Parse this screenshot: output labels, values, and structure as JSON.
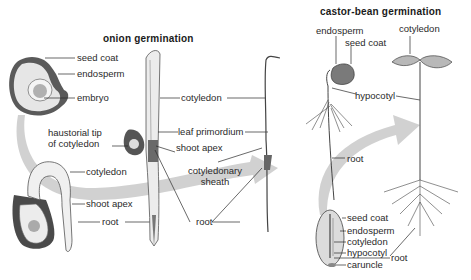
{
  "diagram": {
    "onion": {
      "title": "onion germination",
      "labels": {
        "seed_coat": "seed coat",
        "endosperm": "endosperm",
        "embryo": "embryo",
        "haustorial_tip_1": "haustorial tip",
        "haustorial_tip_2": "of cotyledon",
        "cotyledon_mid": "cotyledon",
        "leaf_primordium": "leaf primordium",
        "shoot_apex_mid": "shoot apex",
        "cotyledonary_1": "cotyledonary",
        "cotyledonary_2": "sheath",
        "cotyledon_lower": "cotyledon",
        "shoot_apex_lower": "shoot apex",
        "root_lower": "root",
        "root_right": "root"
      }
    },
    "castor_bean": {
      "title": "castor-bean germination",
      "labels": {
        "endosperm_top": "endosperm",
        "seed_coat_top": "seed coat",
        "cotyledon_top": "cotyledon",
        "hypocotyl": "hypocotyl",
        "root_mid": "root",
        "seed_coat": "seed coat",
        "endosperm": "endosperm",
        "cotyledon": "cotyledon",
        "hypocotyl_seed": "hypocotyl",
        "caruncle": "caruncle",
        "root_right": "root"
      }
    },
    "colors": {
      "arrow": "#c8c8c8",
      "line": "#2a2a2a",
      "seed_dark": "#4a4a4a",
      "seed_fill": "#d9d9d9"
    }
  }
}
